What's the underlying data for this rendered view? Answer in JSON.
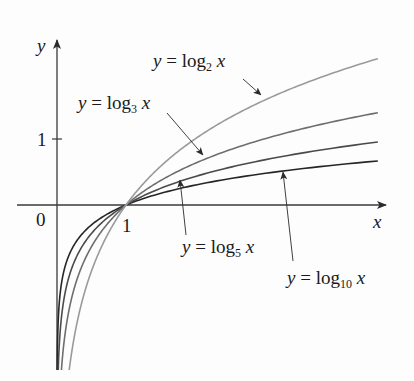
{
  "chart_data": {
    "type": "line",
    "title": "",
    "xlabel": "x",
    "ylabel": "y",
    "x_ticks": [
      {
        "value": 0,
        "label": "0"
      },
      {
        "value": 1,
        "label": "1"
      }
    ],
    "y_ticks": [
      {
        "value": 1,
        "label": "1"
      }
    ],
    "xlim": [
      -0.58,
      4.7
    ],
    "ylim": [
      -2.65,
      2.5
    ],
    "grid": false,
    "legend": "inline annotations with arrows",
    "series": [
      {
        "name": "y = log2 x",
        "base": 2,
        "label_prefix": "y = log",
        "label_sub": "2",
        "label_suffix": " x",
        "color": "#9a9a9a",
        "x": [
          0.07,
          0.25,
          0.5,
          1,
          2,
          3,
          4,
          4.65
        ],
        "y": [
          -3.84,
          -2,
          -1,
          0,
          1,
          1.58,
          2,
          2.22
        ]
      },
      {
        "name": "y = log3 x",
        "base": 3,
        "label_prefix": "y = log",
        "label_sub": "3",
        "label_suffix": " x",
        "color": "#6e6e6e",
        "x": [
          0.05,
          0.25,
          0.5,
          1,
          2,
          3,
          4,
          4.65
        ],
        "y": [
          -2.73,
          -1.26,
          -0.63,
          0,
          0.63,
          1,
          1.26,
          1.4
        ]
      },
      {
        "name": "y = log5 x",
        "base": 5,
        "label_prefix": "y = log",
        "label_sub": "5",
        "label_suffix": " x",
        "color": "#4a4a4a",
        "x": [
          0.02,
          0.25,
          0.5,
          1,
          2,
          3,
          4,
          4.65
        ],
        "y": [
          -2.43,
          -0.86,
          -0.43,
          0,
          0.43,
          0.68,
          0.86,
          0.955
        ]
      },
      {
        "name": "y = log10 x",
        "base": 10,
        "label_prefix": "y = log",
        "label_sub": "10",
        "label_suffix": " x",
        "color": "#262626",
        "x": [
          0.005,
          0.25,
          0.5,
          1,
          2,
          3,
          4,
          4.65
        ],
        "y": [
          -2.3,
          -0.6,
          -0.3,
          0,
          0.3,
          0.48,
          0.6,
          0.667
        ]
      }
    ]
  },
  "axes": {
    "x_label": "x",
    "y_label": "y",
    "origin_label": "0",
    "x_tick_label": "1",
    "y_tick_label": "1"
  },
  "annotations": {
    "log2": {
      "prefix": "y = log",
      "sub": "2",
      "suffix": " x"
    },
    "log3": {
      "prefix": "y = log",
      "sub": "3",
      "suffix": " x"
    },
    "log5": {
      "prefix": "y = log",
      "sub": "5",
      "suffix": " x"
    },
    "log10": {
      "prefix": "y = log",
      "sub": "10",
      "suffix": " x"
    }
  }
}
